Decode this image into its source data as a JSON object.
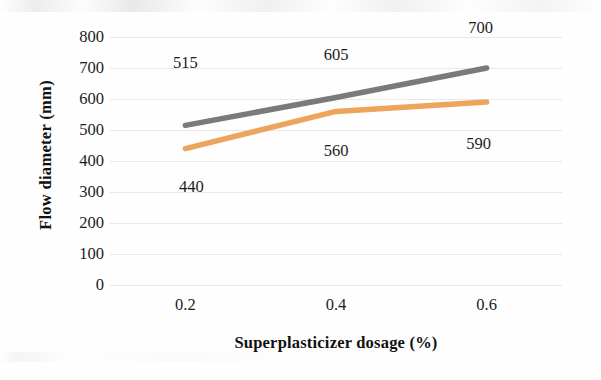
{
  "chart_data": {
    "type": "line",
    "title": "",
    "xlabel": "Superplasticizer dosage (%)",
    "ylabel": "Flow diameter (mm)",
    "categories": [
      "0.2",
      "0.4",
      "0.6"
    ],
    "x": [
      0.2,
      0.4,
      0.6
    ],
    "xlim": [
      0.1,
      0.7
    ],
    "ylim": [
      0,
      800
    ],
    "ytick_labels": [
      "800",
      "700",
      "600",
      "500",
      "400",
      "300",
      "200",
      "100",
      "0"
    ],
    "ytick_values": [
      800,
      700,
      600,
      500,
      400,
      300,
      200,
      100,
      0
    ],
    "grid": true,
    "grid_axis": "y",
    "legend": "none",
    "series": [
      {
        "name": "gray-series",
        "color": "#7a7a7a",
        "values": [
          515,
          605,
          700
        ],
        "labels": [
          "515",
          "605",
          "700"
        ],
        "label_position": "above"
      },
      {
        "name": "orange-series",
        "color": "#eda45c",
        "values": [
          440,
          560,
          590
        ],
        "labels": [
          "440",
          "560",
          "590"
        ],
        "label_position": "below"
      }
    ],
    "annotations": [
      {
        "text": "515",
        "x": 0.2,
        "y": 515,
        "dx": 0,
        "dy": 62
      },
      {
        "text": "605",
        "x": 0.4,
        "y": 605,
        "dx": 0,
        "dy": 42
      },
      {
        "text": "700",
        "x": 0.6,
        "y": 700,
        "dx": -6,
        "dy": 40
      },
      {
        "text": "440",
        "x": 0.2,
        "y": 440,
        "dx": 6,
        "dy": -38
      },
      {
        "text": "560",
        "x": 0.4,
        "y": 560,
        "dx": 0,
        "dy": -40
      },
      {
        "text": "590",
        "x": 0.6,
        "y": 590,
        "dx": -8,
        "dy": -42
      }
    ]
  }
}
